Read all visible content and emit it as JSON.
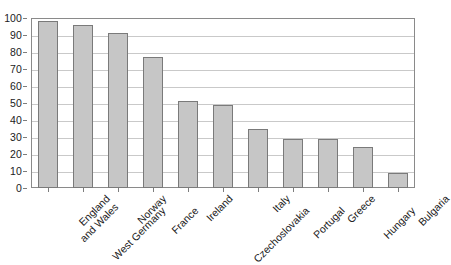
{
  "chart_data": {
    "type": "bar",
    "title": "",
    "subtitle": "",
    "xlabel": "",
    "ylabel": "",
    "ylim": [
      0,
      100
    ],
    "ytick_step": 10,
    "yticks": [
      "100",
      "90",
      "80",
      "70",
      "60",
      "50",
      "40",
      "30",
      "20",
      "10",
      "0"
    ],
    "grid": "horizontal",
    "legend": "none",
    "categories": [
      "England and Wales",
      "West Germany",
      "Norway",
      "France",
      "Ireland",
      "Czechoslovakia",
      "Italy",
      "Portugal",
      "Greece",
      "Hungary",
      "Bulgaria"
    ],
    "category_lines": [
      [
        "England",
        "and Wales"
      ],
      [
        "West Germany"
      ],
      [
        "Norway"
      ],
      [
        "France"
      ],
      [
        "Ireland"
      ],
      [
        "Czechoslovakia"
      ],
      [
        "Italy"
      ],
      [
        "Portugal"
      ],
      [
        "Greece"
      ],
      [
        "Hungary"
      ],
      [
        "Bulgaria"
      ]
    ],
    "values": [
      98,
      96,
      91,
      77,
      51,
      49,
      35,
      29,
      29,
      24,
      9
    ],
    "colors": {
      "bar_fill": "#c6c6c6",
      "bar_border": "#7a7a7a",
      "gridline": "#c9c9c9",
      "frame": "#8a8a8a",
      "text": "#1b1b1b",
      "background": "#ffffff"
    }
  }
}
